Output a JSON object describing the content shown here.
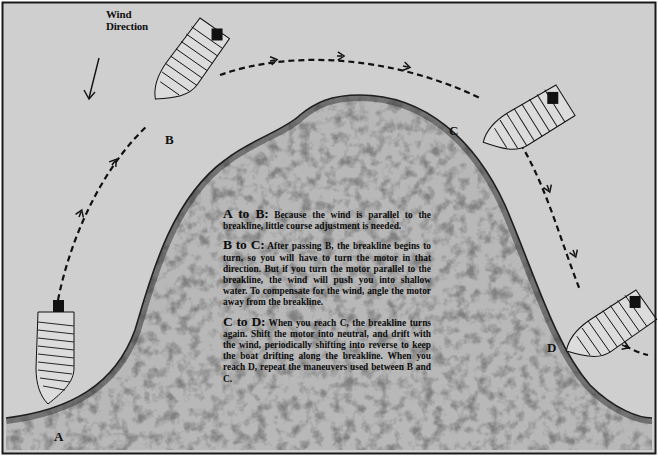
{
  "figure": {
    "wind": {
      "label_line1": "Wind",
      "label_line2": "Direction",
      "arrow_icon": "arrow-down-left"
    },
    "points": {
      "a": "A",
      "b": "B",
      "c": "C",
      "d": "D"
    },
    "instructions": [
      {
        "heading": "A to B:",
        "body": "Because the wind is parallel to the breakline, little course adjustment is needed."
      },
      {
        "heading": "B to C:",
        "body": "After passing B, the breakline begins to turn, so you will have to turn the motor in that direction. But if you turn the motor parallel to the breakline, the wind will push you into shallow water. To compensate for the wind, angle the motor away from the breakline."
      },
      {
        "heading": "C to D:",
        "body": "When you reach C, the breakline turns again. Shift the motor into neutral, and drift with the wind, periodically shifting into reverse to keep the boat drifting along the breakline. When you reach D, repeat the maneuvers used between B and C."
      }
    ],
    "colors": {
      "water": "#cfcfcf",
      "shallow": "#b9b9b9",
      "shallow_texture": "#555555",
      "boat_fill": "#dcdcdc",
      "outline": "#111111",
      "frame": "#1a1a1a"
    }
  }
}
